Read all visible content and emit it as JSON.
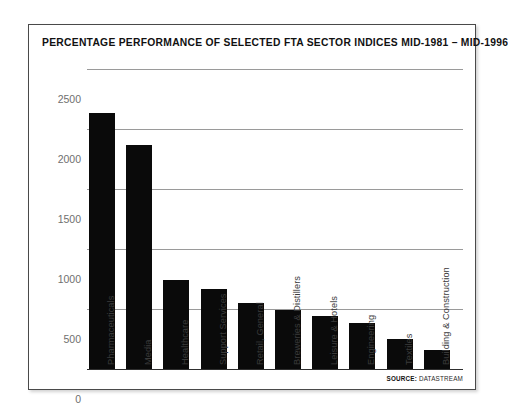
{
  "chart_data": {
    "type": "bar",
    "title": "PERCENTAGE PERFORMANCE OF SELECTED FTA SECTOR INDICES MID-1981 – MID-1996",
    "xlabel": "",
    "ylabel": "",
    "ylim": [
      0,
      2500
    ],
    "yticks": [
      0,
      500,
      1000,
      1500,
      2000,
      2500
    ],
    "ytick_labels": [
      "0",
      "500",
      "1000",
      "1500",
      "2000",
      "2500"
    ],
    "grid": true,
    "legend": null,
    "bar_color": "#0a0a0a",
    "categories": [
      "Pharmaceuticals",
      "Media",
      "Healthcare",
      "Support Services",
      "Retail, General",
      "Breweries & Distillers",
      "Leisure & Hotels",
      "Engineering",
      "Textiles",
      "Building & Construction"
    ],
    "values": [
      2130,
      1870,
      745,
      670,
      550,
      490,
      440,
      385,
      250,
      155
    ]
  },
  "source": {
    "key": "SOURCE:",
    "value": "DATASTREAM"
  },
  "colors": {
    "bar": "#0a0a0a",
    "grid": "#9a9a9a",
    "axis": "#2e2e2e",
    "tick_text": "#6f6f6f",
    "title_text": "#111111",
    "frame": "#4a4a4a",
    "background": "#ffffff"
  }
}
